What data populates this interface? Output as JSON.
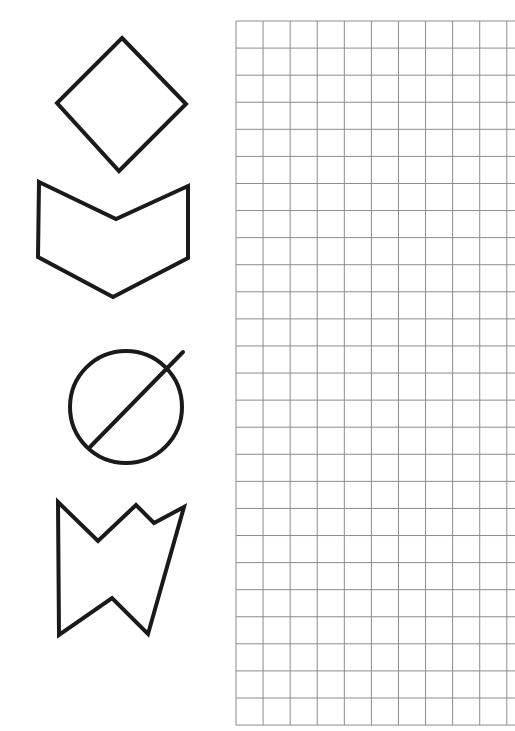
{
  "worksheet": {
    "stroke_color": "#1a1a1a",
    "grid_color": "#8c8c8c",
    "shapes": [
      {
        "name": "diamond",
        "type": "polygon",
        "points": [
          [
            122,
            38
          ],
          [
            186,
            104
          ],
          [
            119,
            171
          ],
          [
            57,
            103
          ]
        ]
      },
      {
        "name": "chevron-pentagon",
        "type": "polygon",
        "points": [
          [
            39,
            182
          ],
          [
            116,
            219
          ],
          [
            188,
            186
          ],
          [
            188,
            258
          ],
          [
            113,
            297
          ],
          [
            38,
            257
          ]
        ]
      },
      {
        "name": "crossed-circle",
        "type": "circle",
        "cx": 126,
        "cy": 407,
        "r": 56,
        "line": [
          [
            90,
            447
          ],
          [
            183,
            352
          ]
        ]
      },
      {
        "name": "notched-shape",
        "type": "polygon",
        "points": [
          [
            58,
            502
          ],
          [
            98,
            541
          ],
          [
            136,
            505
          ],
          [
            154,
            523
          ],
          [
            184,
            507
          ],
          [
            148,
            634
          ],
          [
            112,
            598
          ],
          [
            59,
            635
          ]
        ]
      }
    ],
    "grid": {
      "x0": 236,
      "y0": 21,
      "cell": 27.08,
      "cols": 11,
      "rows": 26,
      "x_end": 515
    }
  }
}
